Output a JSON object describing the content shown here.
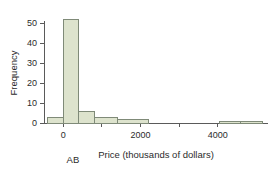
{
  "chart_data": {
    "type": "bar",
    "title": "",
    "subtitle": "",
    "xlabel": "Price (thousands of dollars)",
    "ylabel": "Frequency",
    "xlim": [
      -500,
      5300
    ],
    "ylim": [
      0,
      55
    ],
    "grid": false,
    "legend": null,
    "bar_style": {
      "fill": "#dde3cd",
      "edge": "#7f8a78"
    },
    "xticks": [
      0,
      2000,
      4000
    ],
    "xticklabels": [
      "0",
      "2000",
      "4000"
    ],
    "xminorticks": [
      1000,
      3000
    ],
    "yticks": [
      0,
      10,
      20,
      30,
      40,
      50
    ],
    "yticklabels": [
      "0",
      "10",
      "20",
      "30",
      "40",
      "50"
    ],
    "bins": [
      {
        "start": -400,
        "end": 0,
        "value": 3
      },
      {
        "start": 0,
        "end": 400,
        "value": 52
      },
      {
        "start": 400,
        "end": 800,
        "value": 6
      },
      {
        "start": 800,
        "end": 1400,
        "value": 3
      },
      {
        "start": 1400,
        "end": 2200,
        "value": 2
      },
      {
        "start": 4050,
        "end": 4600,
        "value": 1
      },
      {
        "start": 4600,
        "end": 5150,
        "value": 1
      }
    ],
    "annotations": [
      {
        "text": "AB",
        "x": 250,
        "y": -9
      }
    ]
  }
}
